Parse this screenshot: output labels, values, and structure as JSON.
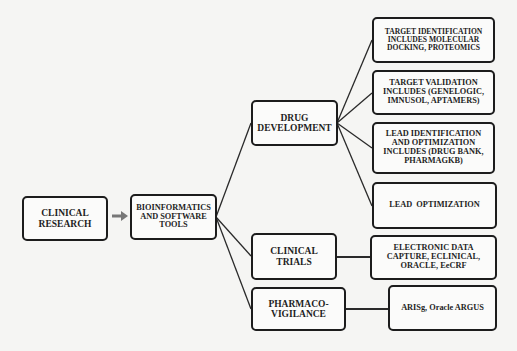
{
  "diagram": {
    "type": "flowchart",
    "colors": {
      "border": "#1c1c1c",
      "line": "#2a2a2a",
      "arrow": "#777777",
      "background": "#f5f5f3"
    },
    "nodes": {
      "clinical_research": "CLINICAL RESEARCH",
      "bioinformatics": "BIOINFORMATICS AND SOFTWARE TOOLS",
      "drug_development": "DRUG DEVELOPMENT",
      "clinical_trials": "CLINICAL TRIALS",
      "pharmacovigilance": "PHARMACO-VIGILANCE",
      "target_identification": "TARGET IDENTIFICATION INCLUDES MOLECULAR DOCKING, PROTEOMICS",
      "target_validation": "TARGET VALIDATION INCLUDES (GENELOGIC, IMNUSOL, APTAMERS)",
      "lead_identification": "LEAD IDENTIFICATION AND OPTIMIZATION INCLUDES (DRUG BANK, PHARMAGKB)",
      "lead_optimization": "LEAD  OPTIMIZATION",
      "edc": "ELECTRONIC DATA CAPTURE, ECLINICAL, ORACLE, EeCRF",
      "arisg": "ARISg, Oracle ARGUS"
    },
    "edges": [
      {
        "from": "clinical_research",
        "to": "bioinformatics",
        "style": "arrow"
      },
      {
        "from": "bioinformatics",
        "to": "drug_development"
      },
      {
        "from": "bioinformatics",
        "to": "clinical_trials"
      },
      {
        "from": "bioinformatics",
        "to": "pharmacovigilance"
      },
      {
        "from": "drug_development",
        "to": "target_identification"
      },
      {
        "from": "drug_development",
        "to": "target_validation"
      },
      {
        "from": "drug_development",
        "to": "lead_identification"
      },
      {
        "from": "drug_development",
        "to": "lead_optimization"
      },
      {
        "from": "clinical_trials",
        "to": "edc"
      },
      {
        "from": "pharmacovigilance",
        "to": "arisg"
      }
    ]
  }
}
